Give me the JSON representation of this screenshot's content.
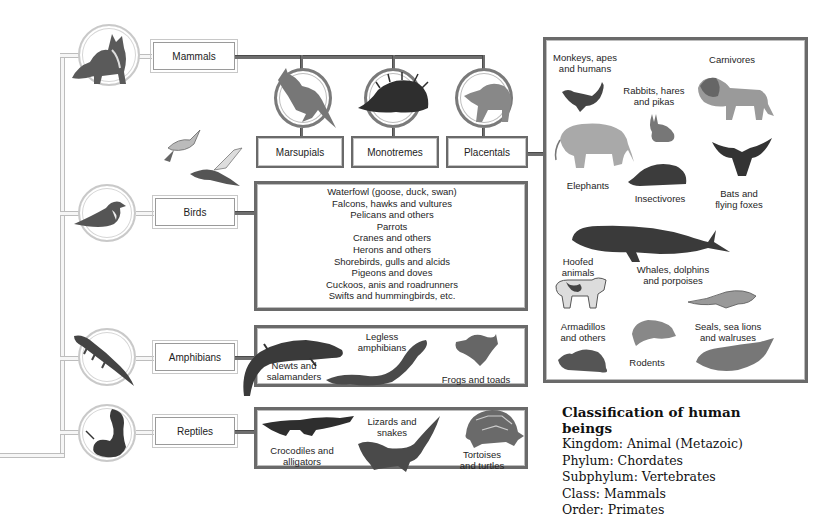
{
  "diagram": {
    "classes": [
      {
        "id": "mammals",
        "label": "Mammals",
        "icon": "dog-icon"
      },
      {
        "id": "birds",
        "label": "Birds",
        "icon": "bird-icon"
      },
      {
        "id": "amphibians",
        "label": "Amphibians",
        "icon": "salamander-icon"
      },
      {
        "id": "reptiles",
        "label": "Reptiles",
        "icon": "snake-icon"
      }
    ],
    "mammal_subclasses": [
      {
        "label": "Marsupials",
        "icon": "kangaroo-icon"
      },
      {
        "label": "Monotremes",
        "icon": "echidna-icon"
      },
      {
        "label": "Placentals",
        "icon": "baboon-icon"
      }
    ],
    "placental_orders": [
      {
        "label": "Monkeys, apes and humans",
        "line1": "Monkeys, apes",
        "line2": "and humans",
        "icon": "monkey-icon"
      },
      {
        "label": "Carnivores",
        "line1": "Carnivores",
        "line2": "",
        "icon": "lion-icon"
      },
      {
        "label": "Rabbits, hares and pikas",
        "line1": "Rabbits, hares",
        "line2": "and pikas",
        "icon": "rabbit-icon"
      },
      {
        "label": "Elephants",
        "line1": "Elephants",
        "line2": "",
        "icon": "elephant-icon"
      },
      {
        "label": "Insectivores",
        "line1": "Insectivores",
        "line2": "",
        "icon": "hedgehog-icon"
      },
      {
        "label": "Bats and flying foxes",
        "line1": "Bats and",
        "line2": "flying foxes",
        "icon": "bat-icon"
      },
      {
        "label": "Hoofed animals",
        "line1": "Hoofed",
        "line2": "animals",
        "icon": "cow-icon"
      },
      {
        "label": "Whales, dolphins and porpoises",
        "line1": "Whales, dolphins",
        "line2": "and porpoises",
        "icon": "whale-icon"
      },
      {
        "label": "Armadillos and others",
        "line1": "Armadillos",
        "line2": "and others",
        "icon": "armadillo-icon"
      },
      {
        "label": "Rodents",
        "line1": "Rodents",
        "line2": "",
        "icon": "rat-icon"
      },
      {
        "label": "Seals, sea lions and walruses",
        "line1": "Seals, sea lions",
        "line2": "and walruses",
        "icon": "seal-icon"
      }
    ],
    "bird_orders": [
      "Waterfowl (goose, duck, swan)",
      "Falcons, hawks and vultures",
      "Pelicans and others",
      "Parrots",
      "Cranes and others",
      "Herons and others",
      "Shorebirds, gulls and alcids",
      "Pigeons and doves",
      "Cuckoos, anis and roadrunners",
      "Swifts and hummingbirds, etc."
    ],
    "amphibian_orders": [
      {
        "line1": "Newts and",
        "line2": "salamanders",
        "icon": "newt-icon"
      },
      {
        "line1": "Legless",
        "line2": "amphibians",
        "icon": "caecilian-icon"
      },
      {
        "line1": "Frogs and toads",
        "line2": "",
        "icon": "frog-icon"
      }
    ],
    "reptile_orders": [
      {
        "line1": "Crocodiles and",
        "line2": "alligators",
        "icon": "crocodile-icon"
      },
      {
        "line1": "Lizards and",
        "line2": "snakes",
        "icon": "lizard-icon"
      },
      {
        "line1": "Tortoises",
        "line2": "and turtles",
        "icon": "tortoise-icon"
      }
    ]
  },
  "classification": {
    "title_line1": "Classification of human",
    "title_line2": "beings",
    "rows": [
      "Kingdom: Animal (Metazoic)",
      "Phylum: Chordates",
      "Subphylum: Vertebrates",
      "Class: Mammals",
      "Order: Primates"
    ]
  },
  "colors": {
    "box_border_dark": "#6a6a6a",
    "connector_light": "#bdbdbd",
    "ink": "#1e1e1e"
  }
}
